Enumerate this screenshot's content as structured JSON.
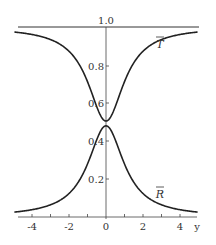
{
  "chart_data": {
    "type": "line",
    "title": "",
    "xlabel": "y",
    "ylabel": "",
    "xlim": [
      -5.0,
      5.0
    ],
    "ylim": [
      0,
      1.0
    ],
    "grid": false,
    "legend": "inline labels",
    "x_ticks": [
      -4,
      -3,
      -2,
      -1,
      0,
      1,
      2,
      3,
      4
    ],
    "x_tick_labels": [
      "-4",
      "-2",
      "0",
      "2",
      "4"
    ],
    "y_ticks": [
      0.2,
      0.4,
      0.6,
      0.8,
      1.0
    ],
    "y_tick_labels": [
      "0.2",
      "0.4",
      "0.6",
      "0.8",
      "1.0"
    ],
    "x": [
      -5,
      -4,
      -3,
      -2,
      -1.5,
      -1,
      -0.5,
      0,
      0.5,
      1,
      1.5,
      2,
      3,
      4,
      5
    ],
    "series": [
      {
        "name": "T̄",
        "values": [
          0.97,
          0.96,
          0.93,
          0.87,
          0.81,
          0.72,
          0.59,
          0.52,
          0.59,
          0.72,
          0.81,
          0.87,
          0.93,
          0.96,
          0.97
        ]
      },
      {
        "name": "R̄",
        "values": [
          0.02,
          0.04,
          0.07,
          0.13,
          0.19,
          0.28,
          0.41,
          0.48,
          0.41,
          0.28,
          0.19,
          0.13,
          0.07,
          0.04,
          0.02
        ]
      }
    ],
    "annotations": [
      {
        "text": "T̄",
        "near_x": 3.0,
        "near_y": 0.88
      },
      {
        "text": "R̄",
        "near_x": 3.0,
        "near_y": 0.18
      }
    ],
    "reference_lines": [
      {
        "type": "horizontal",
        "y": 1.0
      }
    ]
  },
  "labels": {
    "x_axis": "y",
    "y_top": "1.0",
    "y_08": "0.8",
    "y_06": "0.6",
    "y_04": "0.4",
    "y_02": "0.2",
    "x_m4": "-4",
    "x_m2": "-2",
    "x_0": "0",
    "x_2": "2",
    "x_4": "4",
    "curve_T": "T",
    "curve_R": "R"
  }
}
